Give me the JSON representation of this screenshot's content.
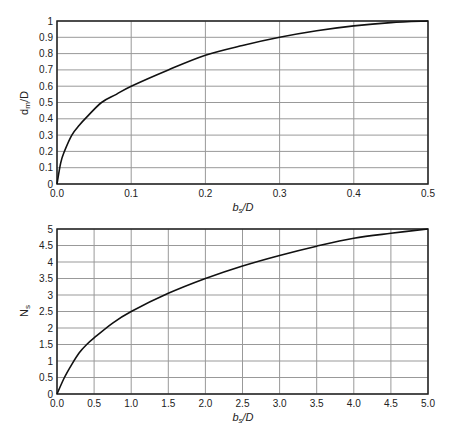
{
  "chart_data": [
    {
      "type": "line",
      "title": "",
      "xlabel": "b_s/D",
      "ylabel": "d_m/D",
      "xlim": [
        0,
        0.5
      ],
      "ylim": [
        0,
        1
      ],
      "grid": true,
      "xticks": [
        "0.0",
        "0.1",
        "0.2",
        "0.3",
        "0.4",
        "0.5"
      ],
      "yticks": [
        "0",
        "0.1",
        "0.2",
        "0.3",
        "0.4",
        "0.5",
        "0.6",
        "0.7",
        "0.8",
        "0.9",
        "1"
      ],
      "series": [
        {
          "name": "d_m/D",
          "x": [
            0,
            0.005,
            0.01,
            0.02,
            0.03,
            0.04,
            0.06,
            0.08,
            0.1,
            0.15,
            0.2,
            0.25,
            0.3,
            0.35,
            0.4,
            0.45,
            0.5
          ],
          "y": [
            0,
            0.13,
            0.2,
            0.3,
            0.36,
            0.41,
            0.5,
            0.55,
            0.6,
            0.7,
            0.79,
            0.85,
            0.9,
            0.94,
            0.97,
            0.99,
            1.0
          ]
        }
      ],
      "plot_box": {
        "left": 57,
        "right": 428,
        "top": 21,
        "bottom": 184
      }
    },
    {
      "type": "line",
      "title": "",
      "xlabel": "b_s/D",
      "ylabel": "N_s",
      "xlim": [
        0,
        5
      ],
      "ylim": [
        0,
        5
      ],
      "grid": true,
      "xticks": [
        "0.0",
        "0.5",
        "1.0",
        "1.5",
        "2.0",
        "2.5",
        "3.0",
        "3.5",
        "4.0",
        "4.5",
        "5.0"
      ],
      "yticks": [
        "0",
        "0.5",
        "1",
        "1.5",
        "2",
        "2.5",
        "3",
        "3.5",
        "4",
        "4.5",
        "5"
      ],
      "series": [
        {
          "name": "N_s",
          "x": [
            0,
            0.1,
            0.2,
            0.3,
            0.4,
            0.5,
            0.75,
            1.0,
            1.5,
            2.0,
            2.5,
            3.0,
            3.5,
            4.0,
            4.5,
            5.0
          ],
          "y": [
            0,
            0.5,
            0.9,
            1.25,
            1.5,
            1.7,
            2.15,
            2.5,
            3.05,
            3.5,
            3.88,
            4.2,
            4.48,
            4.72,
            4.87,
            5.0
          ]
        }
      ],
      "plot_box": {
        "left": 57,
        "right": 428,
        "top": 229,
        "bottom": 394
      }
    }
  ],
  "charts": [
    {
      "ylabel_main": "d",
      "ylabel_sub": "m",
      "ylabel_rest": "/D",
      "xlabel_main": "b",
      "xlabel_sub": "s",
      "xlabel_rest": "/D"
    },
    {
      "ylabel_main": "N",
      "ylabel_sub": "s",
      "ylabel_rest": "",
      "xlabel_main": "b",
      "xlabel_sub": "s",
      "xlabel_rest": "/D"
    }
  ],
  "colors": {
    "grid": "#999999",
    "axis": "#222222",
    "curve": "#111111"
  }
}
